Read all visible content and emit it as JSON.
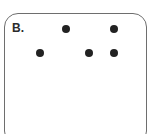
{
  "panel": {
    "label": "B.",
    "border_color": "#6e6e6e",
    "dot_color": "#222222",
    "dots": [
      {
        "x": 66,
        "y": 29
      },
      {
        "x": 114,
        "y": 29
      },
      {
        "x": 40,
        "y": 53
      },
      {
        "x": 89,
        "y": 53
      },
      {
        "x": 114,
        "y": 53
      }
    ]
  }
}
